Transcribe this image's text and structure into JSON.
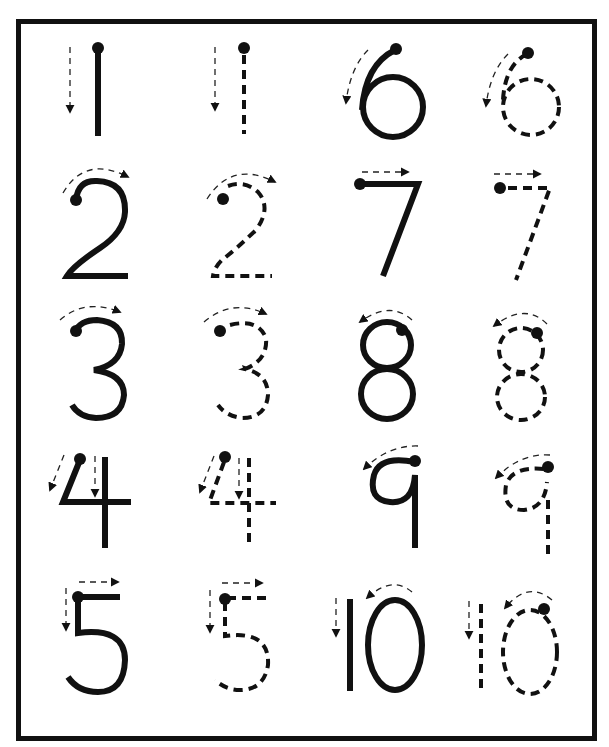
{
  "worksheet": {
    "title": "Number tracing practice 1-10",
    "colors": {
      "ink": "#111111",
      "paper": "#ffffff"
    },
    "columns": [
      "solid model",
      "dashed trace",
      "solid model",
      "dashed trace"
    ],
    "rows": [
      {
        "left_digit": "1",
        "right_digit": "6"
      },
      {
        "left_digit": "2",
        "right_digit": "7"
      },
      {
        "left_digit": "3",
        "right_digit": "8"
      },
      {
        "left_digit": "4",
        "right_digit": "9"
      },
      {
        "left_digit": "5",
        "right_digit": "10"
      }
    ],
    "cells": [
      {
        "digit": "1",
        "style": "solid"
      },
      {
        "digit": "1",
        "style": "dashed"
      },
      {
        "digit": "6",
        "style": "solid"
      },
      {
        "digit": "6",
        "style": "dashed"
      },
      {
        "digit": "2",
        "style": "solid"
      },
      {
        "digit": "2",
        "style": "dashed"
      },
      {
        "digit": "7",
        "style": "solid"
      },
      {
        "digit": "7",
        "style": "dashed"
      },
      {
        "digit": "3",
        "style": "solid"
      },
      {
        "digit": "3",
        "style": "dashed"
      },
      {
        "digit": "8",
        "style": "solid"
      },
      {
        "digit": "8",
        "style": "dashed"
      },
      {
        "digit": "4",
        "style": "solid"
      },
      {
        "digit": "4",
        "style": "dashed"
      },
      {
        "digit": "9",
        "style": "solid"
      },
      {
        "digit": "9",
        "style": "dashed"
      },
      {
        "digit": "5",
        "style": "solid"
      },
      {
        "digit": "5",
        "style": "dashed"
      },
      {
        "digit": "10",
        "style": "solid"
      },
      {
        "digit": "10",
        "style": "dashed"
      }
    ],
    "icons": {
      "start_dot": "start-dot-icon",
      "direction_arrow": "stroke-direction-arrow-icon"
    }
  }
}
